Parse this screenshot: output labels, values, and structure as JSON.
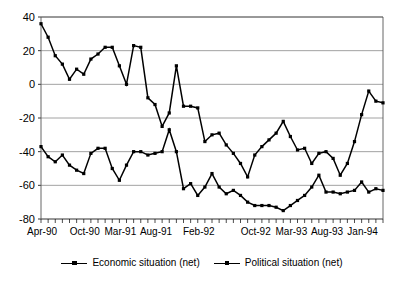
{
  "chart_data": {
    "type": "line",
    "title": "",
    "subtitle": "",
    "xlabel": "",
    "ylabel": "",
    "ylim": [
      -80,
      40
    ],
    "yticks": [
      40,
      20,
      0,
      -20,
      -40,
      -60,
      -80
    ],
    "ytick_labels": [
      "40",
      "20",
      "0",
      "-20",
      "-40",
      "-60",
      "-80"
    ],
    "grid": true,
    "grid_axis": "y",
    "legend_position": "bottom",
    "x": [
      "Apr-90",
      "May-90",
      "Jun-90",
      "Jul-90",
      "Aug-90",
      "Sep-90",
      "Oct-90",
      "Nov-90",
      "Dec-90",
      "Jan-91",
      "Feb-91",
      "Mar-91",
      "Apr-91",
      "May-91",
      "Jun-91",
      "Jul-91",
      "Aug-91",
      "Sep-91",
      "Oct-91",
      "Nov-91",
      "Dec-91",
      "Jan-92",
      "Feb-92",
      "Mar-92",
      "Apr-92",
      "May-92",
      "Jun-92",
      "Jul-92",
      "Aug-92",
      "Sep-92",
      "Oct-92",
      "Nov-92",
      "Dec-92",
      "Jan-93",
      "Feb-93",
      "Mar-93",
      "Apr-93",
      "May-93",
      "Jun-93",
      "Jul-93",
      "Aug-93",
      "Sep-93",
      "Oct-93",
      "Nov-93",
      "Dec-93",
      "Jan-94",
      "Feb-94",
      "Mar-94",
      "Apr-94"
    ],
    "xtick_labels": [
      "Apr-90",
      "Oct-90",
      "Mar-91",
      "Aug-91",
      "Feb-92",
      "Oct-92",
      "Mar-93",
      "Aug-93",
      "Jan-94"
    ],
    "xtick_indices": [
      0,
      6,
      11,
      16,
      22,
      30,
      35,
      40,
      45
    ],
    "series": [
      {
        "name": "Economic situation (net)",
        "color": "#000000",
        "marker": "square",
        "values": [
          36,
          28,
          17,
          12,
          3,
          9,
          6,
          15,
          18,
          22,
          22,
          11,
          0,
          23,
          22,
          -8,
          -12,
          -25,
          -17,
          11,
          -13,
          -13,
          -14,
          -34,
          -30,
          -29,
          -36,
          -41,
          -47,
          -55,
          -42,
          -37,
          -33,
          -29,
          -22,
          -31,
          -39,
          -38,
          -47,
          -41,
          -40,
          -44,
          -54,
          -47,
          -34,
          -18,
          -4,
          -10,
          -11
        ]
      },
      {
        "name": "Political situation (net)",
        "color": "#000000",
        "marker": "square",
        "values": [
          -37,
          -43,
          -46,
          -42,
          -48,
          -51,
          -53,
          -41,
          -38,
          -38,
          -50,
          -57,
          -48,
          -40,
          -40,
          -42,
          -41,
          -40,
          -27,
          -40,
          -62,
          -59,
          -66,
          -61,
          -53,
          -61,
          -65,
          -63,
          -66,
          -70,
          -72,
          -72,
          -72,
          -73,
          -75,
          -72,
          -69,
          -66,
          -61,
          -54,
          -64,
          -64,
          -65,
          -64,
          -63,
          -58,
          -64,
          -62,
          -63
        ]
      }
    ]
  },
  "legend": {
    "items": [
      {
        "label": "Economic situation (net)"
      },
      {
        "label": "Political situation (net)"
      }
    ]
  }
}
